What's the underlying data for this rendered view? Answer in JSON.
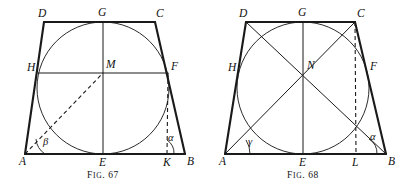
{
  "plate": {
    "width": 402,
    "height": 191,
    "background": "#ffffff",
    "ink_color": "#1a1a1a"
  },
  "figures": [
    {
      "id": "fig-67",
      "caption_prefix": "F",
      "caption_small": "IG",
      "caption_suffix": ". 67",
      "caption_full": "FIG. 67",
      "description": "Isosceles trapezoid ABCD with inscribed circle centred at M, midline HF, vertical diameter GE, dashed line AM and dashed altitude FK, angles alpha at B and beta at A",
      "vertices": {
        "A": {
          "x": 25,
          "y": 154,
          "label": "A",
          "label_x": 19,
          "label_y": 165
        },
        "B": {
          "x": 185,
          "y": 154,
          "label": "B",
          "label_x": 187,
          "label_y": 165
        },
        "C": {
          "x": 155,
          "y": 22,
          "label": "C",
          "label_x": 156,
          "label_y": 17
        },
        "D": {
          "x": 44,
          "y": 22,
          "label": "D",
          "label_x": 38,
          "label_y": 17
        },
        "E": {
          "x": 103,
          "y": 154,
          "label": "E",
          "label_x": 99,
          "label_y": 166
        },
        "F": {
          "x": 168,
          "y": 73,
          "label": "F",
          "label_x": 171,
          "label_y": 70
        },
        "G": {
          "x": 103,
          "y": 22,
          "label": "G",
          "label_x": 98,
          "label_y": 16
        },
        "H": {
          "x": 38,
          "y": 73,
          "label": "H",
          "label_x": 27,
          "label_y": 71
        },
        "K": {
          "x": 167,
          "y": 154,
          "label": "K",
          "label_x": 163,
          "label_y": 166
        },
        "M": {
          "x": 103,
          "y": 73,
          "label": "M",
          "label_x": 106,
          "label_y": 68
        }
      },
      "incircle": {
        "cx": 103,
        "cy": 88,
        "r": 66
      },
      "solid_edges": [
        {
          "name": "side-AB",
          "from": "A",
          "to": "B"
        },
        {
          "name": "side-BC",
          "from": "B",
          "to": "C"
        },
        {
          "name": "side-CD",
          "from": "C",
          "to": "D"
        },
        {
          "name": "side-DA",
          "from": "D",
          "to": "A"
        }
      ],
      "thin_edges": [
        {
          "name": "midline-HF",
          "from": "H",
          "to": "F"
        },
        {
          "name": "axis-GE",
          "from": "G",
          "to": "E"
        }
      ],
      "dashed_edges": [
        {
          "name": "radius-AM",
          "from": "A",
          "to": "M"
        },
        {
          "name": "altitude-FK",
          "from": "F",
          "to": "K"
        }
      ],
      "angles": [
        {
          "name": "angle-beta",
          "label": "β",
          "label_x": 43,
          "label_y": 145,
          "arc": "M 45 154 A 20 20 0 0 1 36 139"
        },
        {
          "name": "angle-alpha",
          "label": "α",
          "label_x": 168,
          "label_y": 141,
          "arc": "M 174 154 A 16 16 0 0 0 167 140"
        }
      ]
    },
    {
      "id": "fig-68",
      "caption_prefix": "F",
      "caption_small": "IG",
      "caption_suffix": ". 68",
      "caption_full": "FIG. 68",
      "description": "Isosceles trapezoid ABCD with inscribed circle, both diagonals AC and DB crossing at N, vertical axis GE, dashed altitude CL, angles alpha at B and gamma at A",
      "vertices": {
        "A": {
          "x": 225,
          "y": 154,
          "label": "A",
          "label_x": 219,
          "label_y": 165
        },
        "B": {
          "x": 386,
          "y": 154,
          "label": "B",
          "label_x": 388,
          "label_y": 165
        },
        "C": {
          "x": 355,
          "y": 22,
          "label": "C",
          "label_x": 357,
          "label_y": 17
        },
        "D": {
          "x": 246,
          "y": 22,
          "label": "D",
          "label_x": 239,
          "label_y": 17
        },
        "E": {
          "x": 303,
          "y": 154,
          "label": "E",
          "label_x": 299,
          "label_y": 166
        },
        "F": {
          "x": 366,
          "y": 73,
          "label": "F",
          "label_x": 370,
          "label_y": 70
        },
        "G": {
          "x": 303,
          "y": 22,
          "label": "G",
          "label_x": 298,
          "label_y": 16
        },
        "H": {
          "x": 239,
          "y": 73,
          "label": "H",
          "label_x": 228,
          "label_y": 71
        },
        "L": {
          "x": 356,
          "y": 154,
          "label": "L",
          "label_x": 352,
          "label_y": 166
        },
        "N": {
          "x": 303,
          "y": 73,
          "label": "N",
          "label_x": 307,
          "label_y": 69
        }
      },
      "incircle": {
        "cx": 303,
        "cy": 88,
        "r": 66
      },
      "solid_edges": [
        {
          "name": "side-AB",
          "from": "A",
          "to": "B"
        },
        {
          "name": "side-BC",
          "from": "B",
          "to": "C"
        },
        {
          "name": "side-CD",
          "from": "C",
          "to": "D"
        },
        {
          "name": "side-DA",
          "from": "D",
          "to": "A"
        }
      ],
      "thin_edges": [
        {
          "name": "diagonal-AC",
          "from": "A",
          "to": "C"
        },
        {
          "name": "diagonal-DB",
          "from": "D",
          "to": "B"
        },
        {
          "name": "axis-GE",
          "from": "G",
          "to": "E"
        }
      ],
      "dashed_edges": [
        {
          "name": "altitude-CL",
          "from": "C",
          "to": "L"
        }
      ],
      "angles": [
        {
          "name": "angle-gamma",
          "label": "γ",
          "label_x": 248,
          "label_y": 145,
          "arc": "M 250 154 A 25 25 0 0 0 246 140"
        },
        {
          "name": "angle-alpha",
          "label": "α",
          "label_x": 370,
          "label_y": 140,
          "arc": "M 377 154 A 17 17 0 0 0 369 139"
        }
      ]
    }
  ]
}
